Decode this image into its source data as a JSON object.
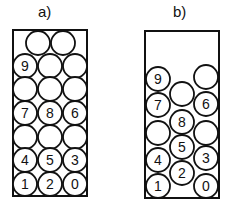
{
  "panels": [
    {
      "label": "a)",
      "label_pos": [
        38,
        3
      ],
      "box": {
        "x": 13,
        "y": 30,
        "w": 74,
        "h": 166
      },
      "circles": [
        {
          "cx": 38,
          "cy": 43,
          "label": ""
        },
        {
          "cx": 63,
          "cy": 43,
          "label": ""
        },
        {
          "cx": 25,
          "cy": 66,
          "label": "9"
        },
        {
          "cx": 50,
          "cy": 66,
          "label": ""
        },
        {
          "cx": 75,
          "cy": 66,
          "label": ""
        },
        {
          "cx": 25,
          "cy": 89,
          "label": ""
        },
        {
          "cx": 50,
          "cy": 89,
          "label": ""
        },
        {
          "cx": 75,
          "cy": 89,
          "label": ""
        },
        {
          "cx": 25,
          "cy": 113,
          "label": "7"
        },
        {
          "cx": 50,
          "cy": 113,
          "label": "8"
        },
        {
          "cx": 75,
          "cy": 113,
          "label": "6"
        },
        {
          "cx": 25,
          "cy": 137,
          "label": ""
        },
        {
          "cx": 50,
          "cy": 137,
          "label": ""
        },
        {
          "cx": 75,
          "cy": 137,
          "label": ""
        },
        {
          "cx": 25,
          "cy": 160,
          "label": "4"
        },
        {
          "cx": 50,
          "cy": 160,
          "label": "5"
        },
        {
          "cx": 75,
          "cy": 160,
          "label": "3"
        },
        {
          "cx": 25,
          "cy": 184,
          "label": "1"
        },
        {
          "cx": 50,
          "cy": 184,
          "label": "2"
        },
        {
          "cx": 75,
          "cy": 184,
          "label": "0"
        }
      ]
    },
    {
      "label": "b)",
      "label_pos": [
        173,
        3
      ],
      "box": {
        "x": 145,
        "y": 31,
        "w": 74,
        "h": 167
      },
      "circles": [
        {
          "cx": 158,
          "cy": 79,
          "label": "9"
        },
        {
          "cx": 206,
          "cy": 77,
          "label": ""
        },
        {
          "cx": 182,
          "cy": 94,
          "label": ""
        },
        {
          "cx": 158,
          "cy": 105,
          "label": "7"
        },
        {
          "cx": 206,
          "cy": 104,
          "label": "6"
        },
        {
          "cx": 182,
          "cy": 122,
          "label": "8"
        },
        {
          "cx": 158,
          "cy": 133,
          "label": ""
        },
        {
          "cx": 206,
          "cy": 133,
          "label": ""
        },
        {
          "cx": 182,
          "cy": 147,
          "label": "5"
        },
        {
          "cx": 158,
          "cy": 160,
          "label": "4"
        },
        {
          "cx": 206,
          "cy": 158,
          "label": "3"
        },
        {
          "cx": 182,
          "cy": 173,
          "label": "2"
        },
        {
          "cx": 158,
          "cy": 186,
          "label": "1"
        },
        {
          "cx": 206,
          "cy": 186,
          "label": "0"
        }
      ]
    }
  ],
  "style": {
    "stroke": "#111111",
    "fill": "#ffffff",
    "radius": 12
  }
}
